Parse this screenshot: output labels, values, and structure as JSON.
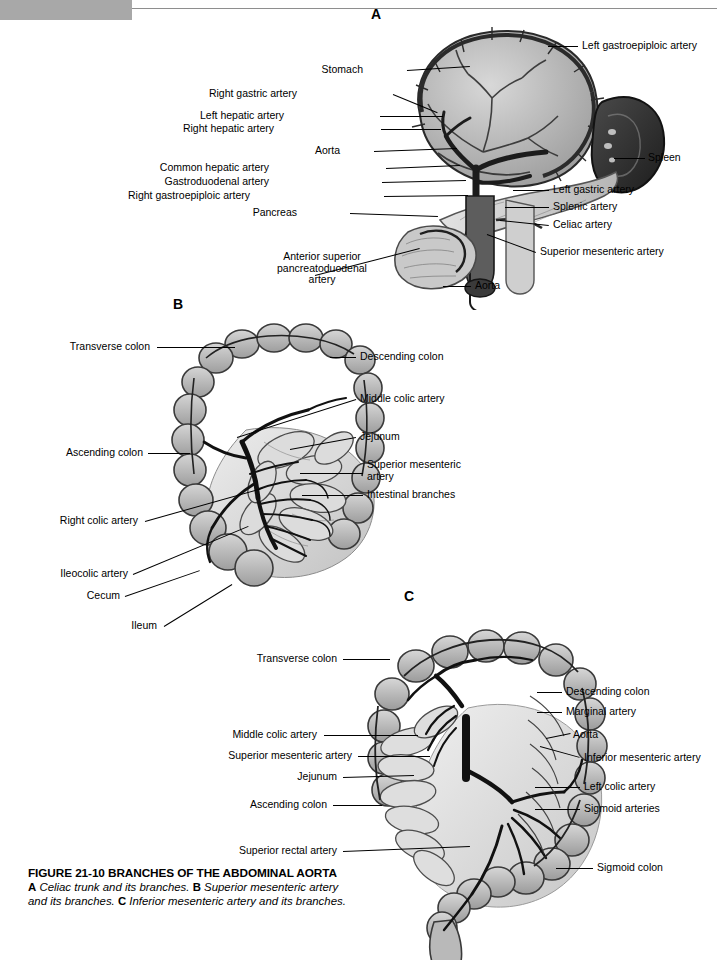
{
  "page": {
    "number": "656",
    "background": "#ffffff",
    "ink": "#000000"
  },
  "panels": [
    {
      "id": "A",
      "letter": "A",
      "x": 371,
      "y": 6
    },
    {
      "id": "B",
      "letter": "B",
      "x": 173,
      "y": 296
    },
    {
      "id": "C",
      "letter": "C",
      "x": 404,
      "y": 588
    }
  ],
  "labels_panel_a": [
    {
      "text": "Left gastroepiploic artery",
      "x": 582,
      "y": 40,
      "align": "left",
      "line": {
        "x1": 548,
        "y1": 46,
        "x2": 578,
        "y2": 46
      }
    },
    {
      "text": "Stomach",
      "x": 363,
      "y": 64,
      "align": "right",
      "line": {
        "x1": 407,
        "y1": 70,
        "x2": 470,
        "y2": 66
      }
    },
    {
      "text": "Right gastric artery",
      "x": 297,
      "y": 88,
      "align": "right",
      "line": {
        "x1": 393,
        "y1": 94,
        "x2": 437,
        "y2": 112
      }
    },
    {
      "text": "Left hepatic artery",
      "x": 284,
      "y": 110,
      "align": "right",
      "line": {
        "x1": 380,
        "y1": 116,
        "x2": 443,
        "y2": 116
      }
    },
    {
      "text": "Right hepatic artery",
      "x": 274,
      "y": 123,
      "align": "right",
      "line": {
        "x1": 381,
        "y1": 129,
        "x2": 441,
        "y2": 129
      }
    },
    {
      "text": "Aorta",
      "x": 340,
      "y": 145,
      "align": "right",
      "line": {
        "x1": 374,
        "y1": 151,
        "x2": 457,
        "y2": 148
      }
    },
    {
      "text": "Common hepatic artery",
      "x": 269,
      "y": 162,
      "align": "right",
      "line": {
        "x1": 386,
        "y1": 168,
        "x2": 460,
        "y2": 165
      }
    },
    {
      "text": "Gastroduodenal artery",
      "x": 269,
      "y": 176,
      "align": "right",
      "line": {
        "x1": 382,
        "y1": 182,
        "x2": 466,
        "y2": 180
      }
    },
    {
      "text": "Right gastroepiploic artery",
      "x": 250,
      "y": 190,
      "align": "right",
      "line": {
        "x1": 384,
        "y1": 196,
        "x2": 468,
        "y2": 195
      }
    },
    {
      "text": "Pancreas",
      "x": 297,
      "y": 207,
      "align": "right",
      "line": {
        "x1": 350,
        "y1": 213,
        "x2": 438,
        "y2": 216
      }
    },
    {
      "text": "Spleen",
      "x": 648,
      "y": 152,
      "align": "left",
      "line": {
        "x1": 614,
        "y1": 158,
        "x2": 645,
        "y2": 158
      }
    },
    {
      "text": "Left gastric artery",
      "x": 553,
      "y": 184,
      "align": "left",
      "line": {
        "x1": 513,
        "y1": 190,
        "x2": 549,
        "y2": 190
      }
    },
    {
      "text": "Splenic artery",
      "x": 553,
      "y": 201,
      "align": "left",
      "line": {
        "x1": 505,
        "y1": 207,
        "x2": 549,
        "y2": 207
      }
    },
    {
      "text": "Celiac artery",
      "x": 553,
      "y": 219,
      "align": "left",
      "line": {
        "x1": 500,
        "y1": 220,
        "x2": 549,
        "y2": 225
      }
    },
    {
      "text": "Superior mesenteric artery",
      "x": 540,
      "y": 246,
      "align": "left",
      "line": {
        "x1": 487,
        "y1": 234,
        "x2": 536,
        "y2": 252
      }
    },
    {
      "text": "Anterior superior\npancreatoduodenal\nartery",
      "x": 322,
      "y": 251,
      "align": "center",
      "line": {
        "x1": 315,
        "y1": 275,
        "x2": 420,
        "y2": 248
      }
    },
    {
      "text": "Aorta",
      "x": 475,
      "y": 280,
      "align": "left",
      "line": {
        "x1": 443,
        "y1": 286,
        "x2": 471,
        "y2": 286
      }
    }
  ],
  "labels_panel_b": [
    {
      "text": "Transverse colon",
      "x": 150,
      "y": 341,
      "align": "right",
      "line": {
        "x1": 157,
        "y1": 347,
        "x2": 235,
        "y2": 347
      }
    },
    {
      "text": "Ascending colon",
      "x": 143,
      "y": 447,
      "align": "right",
      "line": {
        "x1": 148,
        "y1": 453,
        "x2": 190,
        "y2": 453
      }
    },
    {
      "text": "Right colic artery",
      "x": 138,
      "y": 515,
      "align": "right",
      "line": {
        "x1": 145,
        "y1": 521,
        "x2": 262,
        "y2": 488
      }
    },
    {
      "text": "Ileocolic artery",
      "x": 128,
      "y": 568,
      "align": "right",
      "line": {
        "x1": 133,
        "y1": 574,
        "x2": 248,
        "y2": 526
      }
    },
    {
      "text": "Cecum",
      "x": 120,
      "y": 590,
      "align": "right",
      "line": {
        "x1": 125,
        "y1": 596,
        "x2": 200,
        "y2": 570
      }
    },
    {
      "text": "Ileum",
      "x": 157,
      "y": 620,
      "align": "right",
      "line": {
        "x1": 164,
        "y1": 626,
        "x2": 232,
        "y2": 584
      }
    },
    {
      "text": "Descending colon",
      "x": 360,
      "y": 351,
      "align": "left",
      "line": {
        "x1": 330,
        "y1": 357,
        "x2": 356,
        "y2": 357
      }
    },
    {
      "text": "Middle colic artery",
      "x": 360,
      "y": 393,
      "align": "left",
      "line": {
        "x1": 237,
        "y1": 437,
        "x2": 356,
        "y2": 399
      }
    },
    {
      "text": "Jejunum",
      "x": 360,
      "y": 431,
      "align": "left",
      "line": {
        "x1": 290,
        "y1": 449,
        "x2": 356,
        "y2": 437
      }
    },
    {
      "text": "Superior mesenteric\nartery",
      "x": 367,
      "y": 459,
      "align": "left",
      "line": {
        "x1": 300,
        "y1": 473,
        "x2": 363,
        "y2": 473
      }
    },
    {
      "text": "Intestinal branches",
      "x": 367,
      "y": 489,
      "align": "left",
      "line": {
        "x1": 302,
        "y1": 495,
        "x2": 363,
        "y2": 495
      }
    }
  ],
  "labels_panel_c": [
    {
      "text": "Transverse colon",
      "x": 337,
      "y": 653,
      "align": "right",
      "line": {
        "x1": 343,
        "y1": 659,
        "x2": 390,
        "y2": 659
      }
    },
    {
      "text": "Middle colic artery",
      "x": 317,
      "y": 729,
      "align": "right",
      "line": {
        "x1": 324,
        "y1": 735,
        "x2": 418,
        "y2": 735
      }
    },
    {
      "text": "Superior mesenteric artery",
      "x": 352,
      "y": 750,
      "align": "right",
      "line": {
        "x1": 358,
        "y1": 756,
        "x2": 430,
        "y2": 756
      }
    },
    {
      "text": "Jejunum",
      "x": 337,
      "y": 771,
      "align": "right",
      "line": {
        "x1": 343,
        "y1": 777,
        "x2": 414,
        "y2": 775
      }
    },
    {
      "text": "Ascending colon",
      "x": 327,
      "y": 799,
      "align": "right",
      "line": {
        "x1": 333,
        "y1": 805,
        "x2": 382,
        "y2": 805
      }
    },
    {
      "text": "Superior rectal artery",
      "x": 337,
      "y": 845,
      "align": "right",
      "line": {
        "x1": 343,
        "y1": 851,
        "x2": 470,
        "y2": 846
      }
    },
    {
      "text": "Descending colon",
      "x": 566,
      "y": 686,
      "align": "left",
      "line": {
        "x1": 537,
        "y1": 692,
        "x2": 562,
        "y2": 692
      }
    },
    {
      "text": "Marginal artery",
      "x": 566,
      "y": 706,
      "align": "left",
      "line": {
        "x1": 537,
        "y1": 712,
        "x2": 562,
        "y2": 712
      }
    },
    {
      "text": "Aorta",
      "x": 573,
      "y": 729,
      "align": "left",
      "line": {
        "x1": 546,
        "y1": 738,
        "x2": 570,
        "y2": 733
      }
    },
    {
      "text": "Inferior mesenteric artery",
      "x": 584,
      "y": 752,
      "align": "left",
      "line": {
        "x1": 540,
        "y1": 746,
        "x2": 580,
        "y2": 757
      }
    },
    {
      "text": "Left colic artery",
      "x": 584,
      "y": 781,
      "align": "left",
      "line": {
        "x1": 535,
        "y1": 787,
        "x2": 580,
        "y2": 787
      }
    },
    {
      "text": "Sigmoid arteries",
      "x": 584,
      "y": 803,
      "align": "left",
      "line": {
        "x1": 535,
        "y1": 809,
        "x2": 580,
        "y2": 809
      }
    },
    {
      "text": "Sigmoid colon",
      "x": 597,
      "y": 862,
      "align": "left",
      "line": {
        "x1": 556,
        "y1": 868,
        "x2": 593,
        "y2": 868
      }
    }
  ],
  "caption": {
    "title": "FIGURE 21-10 BRANCHES OF THE ABDOMINAL AORTA",
    "parts": [
      {
        "letter": "A",
        "text": "Celiac trunk and its branches."
      },
      {
        "letter": "B",
        "text": "Superior mesenteric artery and its branches."
      },
      {
        "letter": "C",
        "text": "Inferior mesenteric artery and its branches."
      }
    ],
    "full_text": "A Celiac trunk and its branches. B Superior mesenteric artery and its branches. C Inferior mesenteric artery and its branches."
  }
}
